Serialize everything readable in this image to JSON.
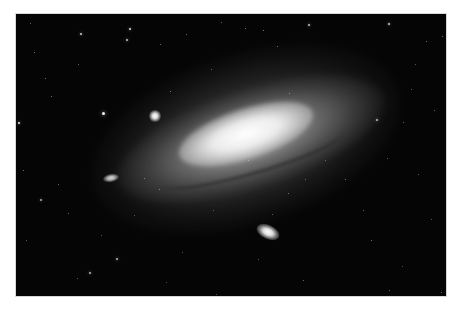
{
  "image": {
    "subject": "Andromeda Galaxy (spiral galaxy with satellite galaxies)",
    "background_color": "#050505",
    "border_color": "#ffffff",
    "frame": {
      "left": 16,
      "top": 14,
      "width": 430,
      "height": 282
    }
  },
  "stars": [
    {
      "x": 64,
      "y": 19,
      "s": 2,
      "o": 0.8
    },
    {
      "x": 113,
      "y": 14,
      "s": 2,
      "o": 0.85
    },
    {
      "x": 110,
      "y": 25,
      "s": 2,
      "o": 0.75
    },
    {
      "x": 2,
      "y": 108,
      "s": 2,
      "o": 0.9
    },
    {
      "x": 86,
      "y": 98,
      "s": 3,
      "o": 0.95
    },
    {
      "x": 18,
      "y": 38,
      "s": 1,
      "o": 0.6
    },
    {
      "x": 29,
      "y": 64,
      "s": 1,
      "o": 0.55
    },
    {
      "x": 35,
      "y": 82,
      "s": 1,
      "o": 0.55
    },
    {
      "x": 62,
      "y": 50,
      "s": 1,
      "o": 0.5
    },
    {
      "x": 154,
      "y": 77,
      "s": 1,
      "o": 0.6
    },
    {
      "x": 170,
      "y": 20,
      "s": 1,
      "o": 0.5
    },
    {
      "x": 195,
      "y": 55,
      "s": 1,
      "o": 0.5
    },
    {
      "x": 14,
      "y": 9,
      "s": 1,
      "o": 0.5
    },
    {
      "x": 144,
      "y": 30,
      "s": 1,
      "o": 0.5
    },
    {
      "x": 229,
      "y": 14,
      "s": 1,
      "o": 0.6
    },
    {
      "x": 247,
      "y": 16,
      "s": 1,
      "o": 0.6
    },
    {
      "x": 292,
      "y": 10,
      "s": 2,
      "o": 0.75
    },
    {
      "x": 372,
      "y": 9,
      "s": 2,
      "o": 0.8
    },
    {
      "x": 410,
      "y": 27,
      "s": 1,
      "o": 0.55
    },
    {
      "x": 426,
      "y": 22,
      "s": 1,
      "o": 0.5
    },
    {
      "x": 399,
      "y": 50,
      "s": 1,
      "o": 0.45
    },
    {
      "x": 360,
      "y": 105,
      "s": 2,
      "o": 0.7
    },
    {
      "x": 387,
      "y": 108,
      "s": 1,
      "o": 0.5
    },
    {
      "x": 418,
      "y": 96,
      "s": 1,
      "o": 0.5
    },
    {
      "x": 273,
      "y": 79,
      "s": 1,
      "o": 0.5
    },
    {
      "x": 205,
      "y": 8,
      "s": 1,
      "o": 0.5
    },
    {
      "x": 261,
      "y": 32,
      "s": 1,
      "o": 0.55
    },
    {
      "x": 395,
      "y": 75,
      "s": 1,
      "o": 0.45
    },
    {
      "x": 7,
      "y": 156,
      "s": 1,
      "o": 0.55
    },
    {
      "x": 24,
      "y": 185,
      "s": 2,
      "o": 0.65
    },
    {
      "x": 52,
      "y": 199,
      "s": 1,
      "o": 0.5
    },
    {
      "x": 100,
      "y": 244,
      "s": 2,
      "o": 0.7
    },
    {
      "x": 73,
      "y": 258,
      "s": 2,
      "o": 0.7
    },
    {
      "x": 42,
      "y": 170,
      "s": 1,
      "o": 0.5
    },
    {
      "x": 128,
      "y": 164,
      "s": 1,
      "o": 0.5
    },
    {
      "x": 143,
      "y": 175,
      "s": 1,
      "o": 0.5
    },
    {
      "x": 166,
      "y": 238,
      "s": 1,
      "o": 0.45
    },
    {
      "x": 61,
      "y": 264,
      "s": 1,
      "o": 0.45
    },
    {
      "x": 10,
      "y": 226,
      "s": 1,
      "o": 0.45
    },
    {
      "x": 329,
      "y": 165,
      "s": 1,
      "o": 0.55
    },
    {
      "x": 355,
      "y": 226,
      "s": 1,
      "o": 0.55
    },
    {
      "x": 272,
      "y": 179,
      "s": 1,
      "o": 0.5
    },
    {
      "x": 289,
      "y": 165,
      "s": 1,
      "o": 0.5
    },
    {
      "x": 371,
      "y": 144,
      "s": 1,
      "o": 0.45
    },
    {
      "x": 402,
      "y": 160,
      "s": 1,
      "o": 0.45
    },
    {
      "x": 347,
      "y": 196,
      "s": 1,
      "o": 0.5
    },
    {
      "x": 256,
      "y": 200,
      "s": 1,
      "o": 0.45
    },
    {
      "x": 287,
      "y": 266,
      "s": 1,
      "o": 0.5
    },
    {
      "x": 373,
      "y": 276,
      "s": 1,
      "o": 0.5
    },
    {
      "x": 425,
      "y": 278,
      "s": 1,
      "o": 0.55
    },
    {
      "x": 415,
      "y": 205,
      "s": 1,
      "o": 0.45
    },
    {
      "x": 309,
      "y": 146,
      "s": 1,
      "o": 0.45
    },
    {
      "x": 232,
      "y": 146,
      "s": 1,
      "o": 0.45
    },
    {
      "x": 386,
      "y": 252,
      "s": 1,
      "o": 0.4
    },
    {
      "x": 242,
      "y": 245,
      "s": 1,
      "o": 0.4
    },
    {
      "x": 197,
      "y": 196,
      "s": 1,
      "o": 0.4
    },
    {
      "x": 118,
      "y": 201,
      "s": 1,
      "o": 0.4
    },
    {
      "x": 85,
      "y": 221,
      "s": 1,
      "o": 0.4
    },
    {
      "x": 150,
      "y": 268,
      "s": 1,
      "o": 0.4
    },
    {
      "x": 200,
      "y": 280,
      "s": 1,
      "o": 0.4
    }
  ]
}
